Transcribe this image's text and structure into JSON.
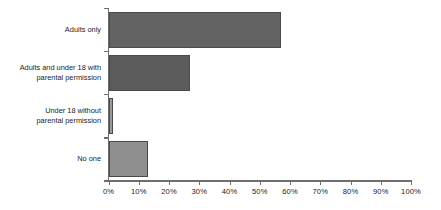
{
  "chart_data": {
    "type": "bar",
    "orientation": "horizontal",
    "title": "",
    "subtitle": "",
    "xlabel": "",
    "ylabel": "",
    "xlim": [
      0,
      100
    ],
    "grid": false,
    "legend": null,
    "categories": [
      "Adults only",
      "Adults and under 18 with\nparental permission",
      "Under 18 without\nparental permission",
      "No one"
    ],
    "values": [
      57,
      27,
      1.5,
      13
    ],
    "value_unit": "%",
    "xticks": [
      0,
      10,
      20,
      30,
      40,
      50,
      60,
      70,
      80,
      90,
      100
    ],
    "xtick_labels": [
      "0%",
      "10%",
      "20%",
      "30%",
      "40%",
      "50%",
      "60%",
      "70%",
      "80%",
      "90%",
      "100%"
    ],
    "bar_colors": [
      "#636363",
      "#5c5c5c",
      "#9a9a9a",
      "#8f8f8f"
    ],
    "bar_border_color": "#4a4a4a",
    "axis_color": "#6e6e6e",
    "text_color": "#1c1c1c",
    "background": "#ffffff"
  }
}
